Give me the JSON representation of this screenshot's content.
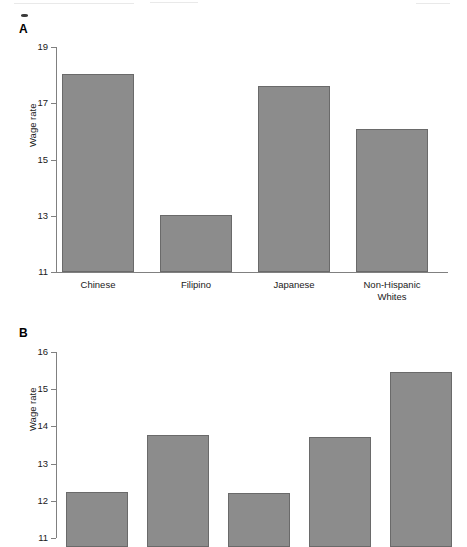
{
  "figure": {
    "panel_a_letter": "A",
    "panel_b_letter": "B"
  },
  "chart_data": [
    {
      "type": "bar",
      "panel": "A",
      "title": "",
      "xlabel": "",
      "ylabel": "Wage rate",
      "categories": [
        "Chinese",
        "Filipino",
        "Japanese",
        "Non-Hispanic\nWhites"
      ],
      "values": [
        18.05,
        13.03,
        17.6,
        16.1
      ],
      "ylim": [
        11,
        19
      ],
      "yticks": [
        11,
        13,
        15,
        17,
        19
      ],
      "ytick_labels": [
        "11",
        "13",
        "15",
        "17",
        "19"
      ],
      "grid": false,
      "legend": "none",
      "bar_color": "#8c8c8c",
      "bar_edge_color": "#6a6a6a",
      "axis_color": "#808080"
    },
    {
      "type": "bar",
      "panel": "B",
      "title": "",
      "xlabel": "",
      "ylabel": "Wage rate",
      "categories": [
        "",
        "",
        "",
        "",
        ""
      ],
      "values": [
        12.25,
        13.77,
        12.2,
        13.72,
        15.45
      ],
      "ylim": [
        11,
        16
      ],
      "yticks": [
        11,
        12,
        13,
        14,
        15,
        16
      ],
      "ytick_labels": [
        "11",
        "12",
        "13",
        "14",
        "15",
        "16"
      ],
      "grid": false,
      "legend": "none",
      "note": "x-axis category labels are cropped off the bottom of the screenshot",
      "bar_color": "#8c8c8c",
      "bar_edge_color": "#6a6a6a",
      "axis_color": "#808080"
    }
  ]
}
